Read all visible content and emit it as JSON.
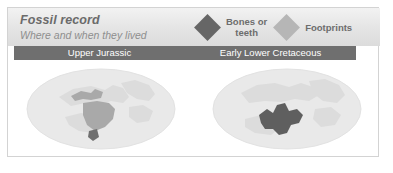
{
  "card": {
    "title": "Fossil record",
    "subtitle": "Where and when they lived"
  },
  "legend": {
    "items": [
      {
        "label": "Bones or\nteeth",
        "icon": "diamond-icon",
        "color": "#666666"
      },
      {
        "label": "Footprints",
        "icon": "diamond-icon",
        "color": "#b6b6b6"
      }
    ]
  },
  "periods": [
    {
      "name": "Upper Jurassic"
    },
    {
      "name": "Early Lower Cretaceous"
    }
  ],
  "maps": [
    {
      "period": "Upper Jurassic",
      "ocean_color": "#e9e9e9",
      "land_color": "#dcdcdc",
      "highlight_color": "#a9a9a9"
    },
    {
      "period": "Early Lower Cretaceous",
      "ocean_color": "#e9e9e9",
      "land_color": "#dcdcdc",
      "highlight_color": "#5f5f5f"
    }
  ]
}
